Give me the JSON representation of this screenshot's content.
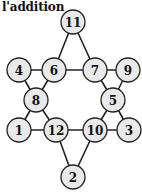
{
  "title": "l'addition",
  "nodes": [
    {
      "id": "n11",
      "label": "11",
      "x": 73,
      "y": 22
    },
    {
      "id": "n4",
      "label": "4",
      "x": 19,
      "y": 70
    },
    {
      "id": "n6",
      "label": "6",
      "x": 54,
      "y": 70
    },
    {
      "id": "n7",
      "label": "7",
      "x": 95,
      "y": 70
    },
    {
      "id": "n9",
      "label": "9",
      "x": 128,
      "y": 70
    },
    {
      "id": "n8",
      "label": "8",
      "x": 36,
      "y": 100
    },
    {
      "id": "n5",
      "label": "5",
      "x": 113,
      "y": 100
    },
    {
      "id": "n1",
      "label": "1",
      "x": 19,
      "y": 130
    },
    {
      "id": "n12",
      "label": "12",
      "x": 56,
      "y": 130
    },
    {
      "id": "n10",
      "label": "10",
      "x": 95,
      "y": 130
    },
    {
      "id": "n3",
      "label": "3",
      "x": 129,
      "y": 130
    },
    {
      "id": "n2",
      "label": "2",
      "x": 73,
      "y": 177
    }
  ],
  "edges": [
    [
      "n11",
      "n6"
    ],
    [
      "n11",
      "n7"
    ],
    [
      "n6",
      "n7"
    ],
    [
      "n4",
      "n6"
    ],
    [
      "n4",
      "n8"
    ],
    [
      "n6",
      "n8"
    ],
    [
      "n7",
      "n9"
    ],
    [
      "n7",
      "n5"
    ],
    [
      "n9",
      "n5"
    ],
    [
      "n8",
      "n1"
    ],
    [
      "n8",
      "n12"
    ],
    [
      "n1",
      "n12"
    ],
    [
      "n5",
      "n10"
    ],
    [
      "n5",
      "n3"
    ],
    [
      "n10",
      "n3"
    ],
    [
      "n12",
      "n10"
    ],
    [
      "n12",
      "n2"
    ],
    [
      "n10",
      "n2"
    ]
  ],
  "node_radius": 12
}
